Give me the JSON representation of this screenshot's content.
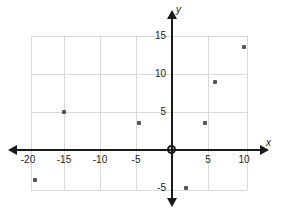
{
  "chart_data": {
    "type": "scatter",
    "title": "",
    "xlabel": "x",
    "ylabel": "y",
    "xlim": [
      -20.5,
      10.5
    ],
    "ylim": [
      -6.5,
      16.5
    ],
    "grid": true,
    "legend": false,
    "x_ticks": [
      -20,
      -15,
      -10,
      -5,
      5,
      10
    ],
    "y_ticks": [
      15,
      10,
      5,
      -5
    ],
    "x_tick_labels": [
      "-20",
      "-15",
      "-10",
      "-5",
      "5",
      "10"
    ],
    "y_tick_labels": [
      "15",
      "10",
      "5",
      "-5"
    ],
    "points": [
      {
        "x": -19,
        "y": -4
      },
      {
        "x": -15,
        "y": 5
      },
      {
        "x": -4.6,
        "y": 3.5
      },
      {
        "x": 2,
        "y": -5
      },
      {
        "x": 4.6,
        "y": 3.5
      },
      {
        "x": 6,
        "y": 9
      },
      {
        "x": 10,
        "y": 13.5
      }
    ],
    "point_color": "#555555",
    "axis_color": "#1a1a1a",
    "grid_color": "#d9d9d9",
    "background_color": "#ffffff",
    "origin_label": "0"
  },
  "axes": {
    "x_axis_name": "x",
    "y_axis_name": "y"
  }
}
